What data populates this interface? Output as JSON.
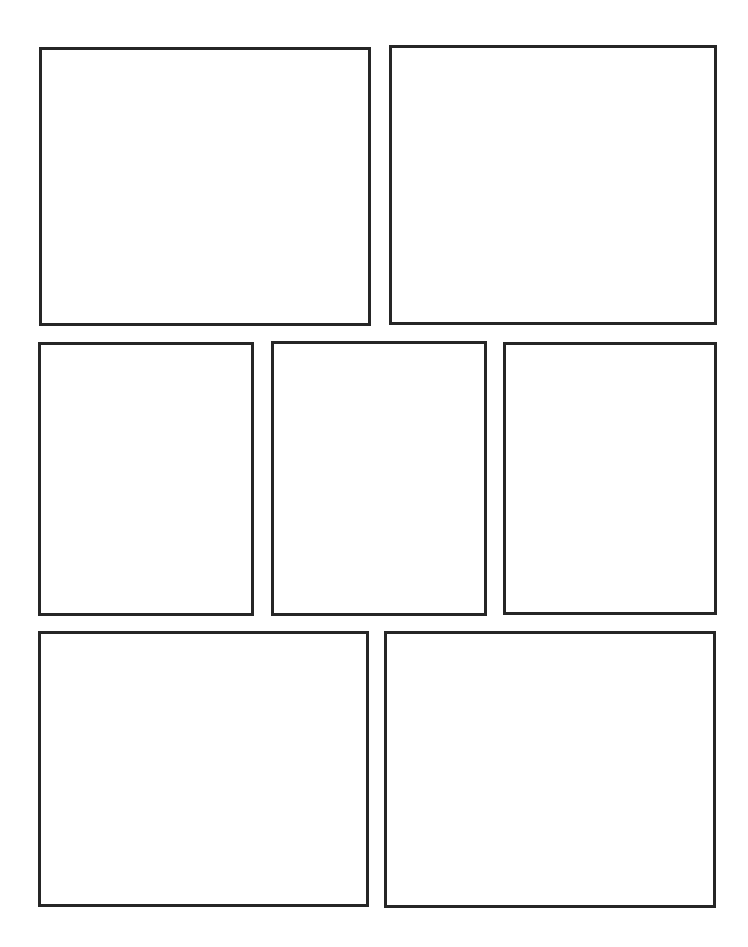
{
  "page": {
    "width": 748,
    "height": 947,
    "background_color": "#ffffff",
    "border_color": "#262626",
    "border_width": 3,
    "panel_count": 7,
    "row_count": 3,
    "rows_layout": [
      2,
      3,
      2
    ]
  },
  "panels": [
    {
      "id": "panel-1",
      "label": "",
      "row": 1,
      "index_in_row": 1,
      "x": 39,
      "y": 47,
      "width": 332,
      "height": 279,
      "border_color": "#262626",
      "border_width": 3,
      "fill_color": "#ffffff",
      "content": ""
    },
    {
      "id": "panel-2",
      "label": "",
      "row": 1,
      "index_in_row": 2,
      "x": 389,
      "y": 45,
      "width": 328,
      "height": 280,
      "border_color": "#262626",
      "border_width": 3,
      "fill_color": "#ffffff",
      "content": ""
    },
    {
      "id": "panel-3",
      "label": "",
      "row": 2,
      "index_in_row": 1,
      "x": 38,
      "y": 342,
      "width": 216,
      "height": 274,
      "border_color": "#262626",
      "border_width": 3,
      "fill_color": "#ffffff",
      "content": ""
    },
    {
      "id": "panel-4",
      "label": "",
      "row": 2,
      "index_in_row": 2,
      "x": 271,
      "y": 341,
      "width": 216,
      "height": 275,
      "border_color": "#262626",
      "border_width": 3,
      "fill_color": "#ffffff",
      "content": ""
    },
    {
      "id": "panel-5",
      "label": "",
      "row": 2,
      "index_in_row": 3,
      "x": 503,
      "y": 342,
      "width": 214,
      "height": 273,
      "border_color": "#262626",
      "border_width": 3,
      "fill_color": "#ffffff",
      "content": ""
    },
    {
      "id": "panel-6",
      "label": "",
      "row": 3,
      "index_in_row": 1,
      "x": 38,
      "y": 631,
      "width": 331,
      "height": 276,
      "border_color": "#262626",
      "border_width": 3,
      "fill_color": "#ffffff",
      "content": ""
    },
    {
      "id": "panel-7",
      "label": "",
      "row": 3,
      "index_in_row": 2,
      "x": 384,
      "y": 631,
      "width": 332,
      "height": 277,
      "border_color": "#262626",
      "border_width": 3,
      "fill_color": "#ffffff",
      "content": ""
    }
  ]
}
